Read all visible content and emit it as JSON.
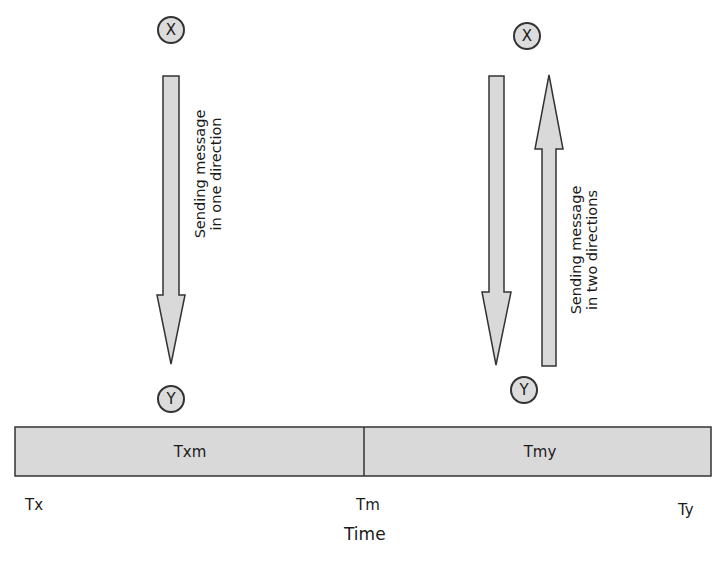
{
  "diagram": {
    "nodes": {
      "left_sender": "X",
      "left_receiver": "Y",
      "right_sender": "X",
      "right_receiver": "Y"
    },
    "labels": {
      "one_direction": [
        "Sending message",
        "in one direction"
      ],
      "two_directions": [
        "Sending message",
        "in two directions"
      ]
    },
    "timeline": {
      "segments": [
        "Txm",
        "Tmy"
      ],
      "ticks": [
        "Tx",
        "Tm",
        "Ty"
      ],
      "axis_label": "Time"
    },
    "colors": {
      "fill": "#d9d9d9",
      "stroke": "#333333"
    }
  }
}
